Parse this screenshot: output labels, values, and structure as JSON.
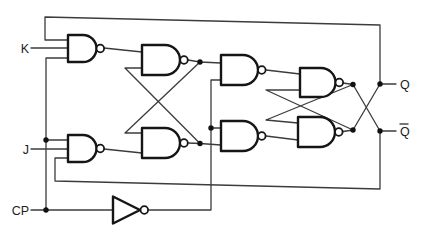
{
  "diagram": {
    "background_color": "#ffffff",
    "gate_ink_color": "#151515",
    "wire_color": "#3c3c3c",
    "inputs": [
      {
        "id": "K",
        "label": "K"
      },
      {
        "id": "J",
        "label": "J"
      },
      {
        "id": "CP",
        "label": "CP"
      }
    ],
    "outputs": [
      {
        "id": "Q",
        "label": "Q",
        "overline": false
      },
      {
        "id": "Q-bar",
        "label": "Q",
        "overline": true
      }
    ],
    "gates": [
      {
        "id": "G1",
        "type": "NAND",
        "input_count": 3
      },
      {
        "id": "G2",
        "type": "NAND",
        "input_count": 2
      },
      {
        "id": "G3",
        "type": "NAND",
        "input_count": 3
      },
      {
        "id": "G4",
        "type": "NAND",
        "input_count": 2
      },
      {
        "id": "G5",
        "type": "NAND",
        "input_count": 2
      },
      {
        "id": "G6",
        "type": "NAND",
        "input_count": 2
      },
      {
        "id": "G7",
        "type": "NAND",
        "input_count": 2
      },
      {
        "id": "G8",
        "type": "NAND",
        "input_count": 2
      },
      {
        "id": "INV",
        "type": "NOT",
        "input_count": 1
      }
    ]
  }
}
